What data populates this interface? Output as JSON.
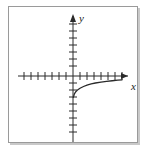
{
  "figure": {
    "title": "",
    "caption": ""
  },
  "axes": {
    "x_label": "x",
    "y_label": "y",
    "x_label_name": "x-axis-label",
    "y_label_name": "y-axis-label",
    "arrow_x": "right-arrowhead",
    "arrow_y": "up-arrowhead",
    "axis_color": "#2b2b2b",
    "frame_color": "#9a9a9a",
    "shadow_color": "#c9c9c9",
    "curve_color": "#2b2b2b"
  },
  "chart_data": {
    "type": "line",
    "title": "",
    "subtitle": "",
    "xlabel": "x",
    "ylabel": "y",
    "xlim": [
      -8,
      8
    ],
    "ylim": [
      -8,
      8
    ],
    "grid": false,
    "legend": null,
    "x_ticks": [
      -7,
      -6,
      -5,
      -4,
      -3,
      -2,
      -1,
      1,
      2,
      3,
      4,
      5,
      6,
      7
    ],
    "y_ticks": [
      -7,
      -6,
      -5,
      -4,
      -3,
      -2,
      -1,
      1,
      2,
      3,
      4,
      5,
      6,
      7
    ],
    "x_tick_labels": [],
    "y_tick_labels": [],
    "annotations": [],
    "series": [
      {
        "name": "logarithmic-curve",
        "description": "increasing concave-down curve rising from near the y-axis at y = -3 toward y = -0.5 at x = 7",
        "x": [
          0.05,
          0.2,
          0.4,
          0.7,
          1.0,
          1.5,
          2.0,
          2.6,
          3.2,
          4.0,
          4.8,
          5.6,
          6.4,
          7.0
        ],
        "y": [
          -3.05,
          -2.55,
          -2.25,
          -1.95,
          -1.75,
          -1.5,
          -1.3,
          -1.13,
          -1.0,
          -0.87,
          -0.76,
          -0.68,
          -0.6,
          -0.55
        ]
      }
    ]
  }
}
